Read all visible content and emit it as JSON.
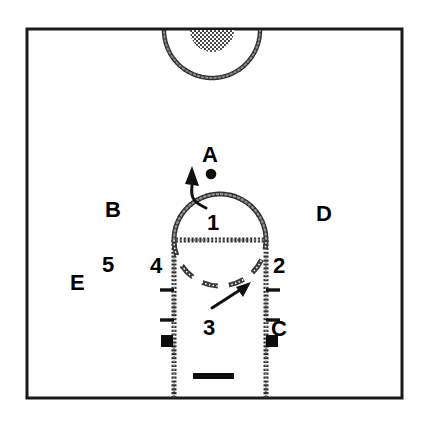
{
  "diagram": {
    "background_color": "#ffffff",
    "line_color": "#1a1a1a",
    "court": {
      "border_label": "court-boundary",
      "x": 27,
      "y": 29,
      "width": 375,
      "height": 369,
      "border_width": 3
    },
    "markings": {
      "center_circle": "center-circle-half",
      "center_circle_fill": "hatched-semicircle",
      "free_throw_circle_top": "solid-arc",
      "free_throw_circle_bottom": "dashed-arc",
      "free_throw_line": "free-throw-line",
      "lane": "free-throw-lane",
      "backboard": "backboard-bar",
      "lane_blocks": "lane-block-marks",
      "lane_ticks": "lane-tick-marks"
    },
    "ball": {
      "name": "ball-dot",
      "cx": 211,
      "cy": 174,
      "r": 5
    }
  },
  "labels": {
    "letters": [
      {
        "id": "A",
        "text": "A",
        "x": 202,
        "y": 144,
        "note": "ball position above key"
      },
      {
        "id": "B",
        "text": "B",
        "x": 105,
        "y": 199,
        "note": "left wing"
      },
      {
        "id": "C",
        "text": "C",
        "x": 271,
        "y": 318,
        "note": "right low block"
      },
      {
        "id": "D",
        "text": "D",
        "x": 316,
        "y": 203,
        "note": "right wing"
      },
      {
        "id": "E",
        "text": "E",
        "x": 70,
        "y": 272,
        "note": "left corner"
      }
    ],
    "numbers": [
      {
        "id": "1",
        "text": "1",
        "x": 207,
        "y": 212,
        "note": "top of key position"
      },
      {
        "id": "2",
        "text": "2",
        "x": 273,
        "y": 255,
        "note": "right elbow"
      },
      {
        "id": "3",
        "text": "3",
        "x": 203,
        "y": 317,
        "note": "low post"
      },
      {
        "id": "4",
        "text": "4",
        "x": 150,
        "y": 255,
        "note": "left elbow"
      },
      {
        "id": "5",
        "text": "5",
        "x": 102,
        "y": 254,
        "note": "left high"
      }
    ]
  },
  "arrows": [
    {
      "name": "arrow-from-1-to-A",
      "from_label": "1",
      "to_label": "A",
      "direction": "up-left",
      "style": "curved"
    },
    {
      "name": "arrow-from-3-to-arc",
      "from_label": "3",
      "to_label": "dashed-arc",
      "direction": "up-right",
      "style": "straight"
    }
  ]
}
